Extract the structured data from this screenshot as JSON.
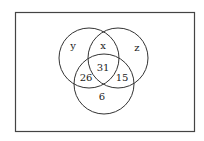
{
  "diagram": {
    "type": "venn",
    "sets": [
      {
        "name": "y",
        "label": "y"
      },
      {
        "name": "x",
        "label": "x"
      },
      {
        "name": "z",
        "label": "z"
      }
    ],
    "regions": {
      "y_only": "y",
      "x_label": "x",
      "z_only": "z",
      "center": "31",
      "left_bottom_overlap": "26",
      "right_bottom_overlap": "15",
      "bottom_only": "6"
    },
    "colors": {
      "stroke": "#333333",
      "background": "#ffffff"
    }
  }
}
